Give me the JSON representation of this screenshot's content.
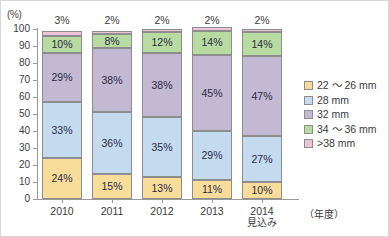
{
  "chart_data": {
    "type": "bar",
    "title": "",
    "subtitle": "",
    "stacked": true,
    "stack_mode": "percent",
    "xlabel": "（年度）",
    "ylabel": "(%)",
    "ylim": [
      0,
      100
    ],
    "grid": false,
    "legend_position": "right",
    "y_unit_label": "(%)",
    "y_ticks": [
      100,
      90,
      80,
      70,
      60,
      50,
      40,
      30,
      20,
      10,
      0
    ],
    "categories": [
      "2010",
      "2011",
      "2012",
      "2013",
      "2014"
    ],
    "category_sublabels": [
      "",
      "",
      "",
      "",
      "見込み"
    ],
    "series": [
      {
        "name": "22 ～ 26 mm",
        "color": "#f8dd9a",
        "values": [
          24,
          15,
          13,
          11,
          10
        ]
      },
      {
        "name": "28 mm",
        "color": "#c3daef",
        "values": [
          33,
          36,
          35,
          29,
          27
        ]
      },
      {
        "name": "32 mm",
        "color": "#c3b9d2",
        "values": [
          29,
          38,
          38,
          45,
          47
        ]
      },
      {
        "name": "34 ～ 36 mm",
        "color": "#b7dba0",
        "values": [
          10,
          8,
          12,
          14,
          14
        ]
      },
      {
        "name": ">38 mm",
        "color": "#eec5d8",
        "values": [
          3,
          2,
          2,
          2,
          2
        ]
      }
    ],
    "bar_segment_labels": [
      [
        "24%",
        "33%",
        "29%",
        "10%",
        ""
      ],
      [
        "15%",
        "36%",
        "38%",
        "8%",
        ""
      ],
      [
        "13%",
        "35%",
        "38%",
        "12%",
        ""
      ],
      [
        "11%",
        "29%",
        "45%",
        "14%",
        ""
      ],
      [
        "10%",
        "27%",
        "47%",
        "14%",
        ""
      ]
    ],
    "top_labels": [
      "3%",
      "2%",
      "2%",
      "2%",
      "2%"
    ],
    "legend": [
      {
        "label": "22 ～ 26 mm",
        "color": "#f8dd9a"
      },
      {
        "label": "28 mm",
        "color": "#c3daef"
      },
      {
        "label": "32 mm",
        "color": "#c3b9d2"
      },
      {
        "label": "34 ～ 36 mm",
        "color": "#b7dba0"
      },
      {
        "label": ">38 mm",
        "color": "#eec5d8"
      }
    ]
  }
}
